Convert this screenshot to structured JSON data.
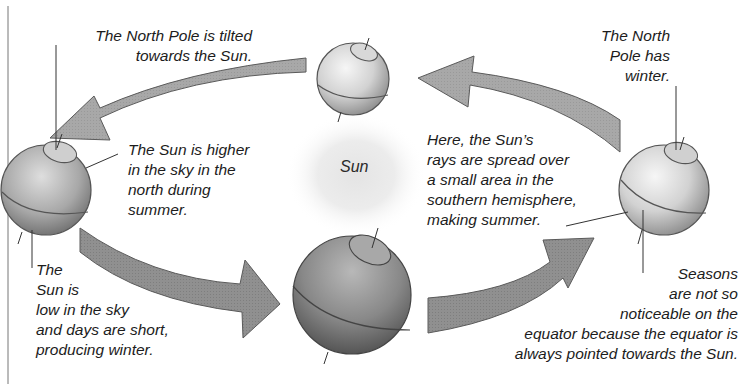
{
  "diagram": {
    "type": "seasons-orbit-diagram",
    "sun": {
      "label": "Sun"
    },
    "earths": [
      {
        "position": "left",
        "season_north": "summer"
      },
      {
        "position": "top"
      },
      {
        "position": "right",
        "season_north": "winter"
      },
      {
        "position": "bottom"
      }
    ],
    "labels": {
      "north_pole_tilted": "The North Pole is tilted\ntowards the Sun.",
      "sun_higher": "The Sun is higher\nin the sky in the\nnorth during\nsummer.",
      "sun_low": "The\nSun is\nlow in the sky\nand days are short,\nproducing winter.",
      "north_pole_winter": "The North\nPole has\nwinter.",
      "sun_rays_spread": "Here, the Sun’s\nrays are spread over\na small area in the\nsouthern hemisphere,\nmaking summer.",
      "equator_note": "Seasons\nare not so\nnoticeable on the\nequator because the equator is\nalways pointed towards the Sun."
    },
    "colors": {
      "arrow_fill": "#a9a9a9",
      "arrow_stroke": "#5a5a5a",
      "globe_dark": "#6e6e6e",
      "globe_light": "#e6e6e6",
      "sun_glow": "#d8d8d8",
      "text": "#1c1c1c"
    }
  }
}
